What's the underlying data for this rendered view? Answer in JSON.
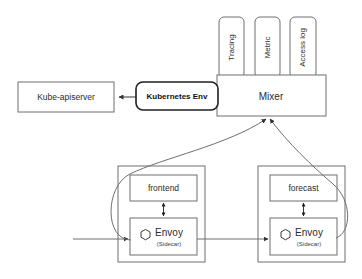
{
  "diagram": {
    "background_color": "#ffffff",
    "stroke_color": "#6f6f6f",
    "text_color": "#2b2b2b",
    "nodes": {
      "kube_apiserver": {
        "label": "Kube-apiserver",
        "x": 18,
        "y": 82,
        "w": 96,
        "h": 30
      },
      "kubernetes_env": {
        "label": "Kubernetes Env",
        "x": 136,
        "y": 82,
        "w": 82,
        "h": 28
      },
      "mixer": {
        "label": "Mixer",
        "x": 217,
        "y": 75,
        "w": 109,
        "h": 41
      },
      "tracing": {
        "label": "Tracing",
        "x": 219,
        "y": 17,
        "w": 25,
        "h": 61
      },
      "metric": {
        "label": "Metric",
        "x": 255,
        "y": 17,
        "w": 25,
        "h": 61
      },
      "access_log": {
        "label": "Access log",
        "x": 290,
        "y": 17,
        "w": 26,
        "h": 61
      },
      "pod_left": {
        "label": "",
        "x": 118,
        "y": 166,
        "w": 87,
        "h": 96
      },
      "pod_right": {
        "label": "",
        "x": 258,
        "y": 166,
        "w": 87,
        "h": 96
      },
      "frontend": {
        "label": "frontend",
        "x": 130,
        "y": 175,
        "w": 67,
        "h": 26
      },
      "forecast": {
        "label": "forecast",
        "x": 270,
        "y": 175,
        "w": 67,
        "h": 26
      },
      "envoy_left": {
        "label": "Envoy",
        "sublabel": "(Sidecar)",
        "x": 130,
        "y": 218,
        "w": 67,
        "h": 37
      },
      "envoy_right": {
        "label": "Envoy",
        "sublabel": "(Sidecar)",
        "x": 270,
        "y": 218,
        "w": 67,
        "h": 37
      }
    },
    "edges": [
      {
        "name": "kubernetes-env-to-apiserver",
        "kind": "arrow-left"
      },
      {
        "name": "frontend-envoy-bidirectional",
        "kind": "double-arrow-vertical"
      },
      {
        "name": "forecast-envoy-bidirectional",
        "kind": "double-arrow-vertical"
      },
      {
        "name": "ingress-to-envoy-left",
        "kind": "arrow-right"
      },
      {
        "name": "envoy-left-to-envoy-right",
        "kind": "arrow-right"
      },
      {
        "name": "envoy-left-to-mixer",
        "kind": "curve-arrow-up"
      },
      {
        "name": "envoy-right-to-mixer",
        "kind": "curve-arrow-up"
      }
    ]
  }
}
